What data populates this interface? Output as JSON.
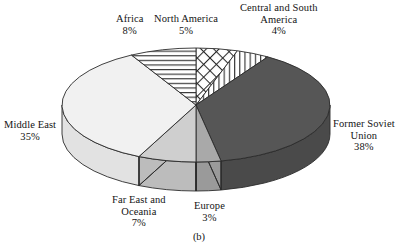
{
  "figure": {
    "caption": "(b)",
    "geometry": {
      "cx": 196,
      "cy": 105,
      "rx": 134,
      "ry": 57,
      "depth": 29,
      "start_angle_deg": -90,
      "direction": "clockwise"
    }
  },
  "chart_data": {
    "type": "pie",
    "title": "",
    "subtitle": "",
    "xlabel": "",
    "ylabel": "",
    "legend_position": "outside-labels",
    "grid": false,
    "units": "percent",
    "categories": [
      "North America",
      "Central and South America",
      "Former Soviet Union",
      "Europe",
      "Far East and Oceania",
      "Middle East",
      "Africa"
    ],
    "values": [
      5,
      4,
      38,
      3,
      7,
      35,
      8
    ],
    "value_labels": [
      "5%",
      "4%",
      "38%",
      "3%",
      "7%",
      "35%",
      "8%"
    ],
    "slices": [
      {
        "label": "North America",
        "value": 5,
        "value_label": "5%",
        "fill": "crosshatch",
        "color": "#ffffff",
        "side_color": "#e8e8e8",
        "label_pos": {
          "left": 154,
          "top": 13
        },
        "align": "center"
      },
      {
        "label": "Central and South America",
        "label_line1": "Central and South",
        "label_line2": "America",
        "value": 4,
        "value_label": "4%",
        "fill": "vertical-lines",
        "color": "#ffffff",
        "side_color": "#e8e8e8",
        "label_pos": {
          "left": 240,
          "top": 2
        },
        "align": "center"
      },
      {
        "label": "Former Soviet Union",
        "label_line1": "Former Soviet",
        "label_line2": "Union",
        "value": 38,
        "value_label": "38%",
        "fill": "solid",
        "color": "#565656",
        "side_color": "#4a4a4a",
        "label_pos": {
          "left": 333,
          "top": 118
        },
        "align": "center"
      },
      {
        "label": "Europe",
        "value": 3,
        "value_label": "3%",
        "fill": "solid",
        "color": "#a9a9a9",
        "side_color": "#9a9a9a",
        "label_pos": {
          "left": 194,
          "top": 200
        },
        "align": "center"
      },
      {
        "label": "Far East and Oceania",
        "label_line1": "Far East and",
        "label_line2": "Oceania",
        "value": 7,
        "value_label": "7%",
        "fill": "solid",
        "color": "#cfcfcf",
        "side_color": "#bcbcbc",
        "label_pos": {
          "left": 112,
          "top": 194
        },
        "align": "center"
      },
      {
        "label": "Middle East",
        "value": 35,
        "value_label": "35%",
        "fill": "solid",
        "color": "#f1f1f1",
        "side_color": "#e2e2e2",
        "label_pos": {
          "left": 4,
          "top": 119
        },
        "align": "center"
      },
      {
        "label": "Africa",
        "value": 8,
        "value_label": "8%",
        "fill": "horizontal-lines",
        "color": "#ffffff",
        "side_color": "#e8e8e8",
        "label_pos": {
          "left": 116,
          "top": 13
        },
        "align": "center"
      }
    ],
    "colors": {
      "outline": "#2b2b2b",
      "background": "#ffffff",
      "text": "#141414",
      "former_soviet_union": "#565656",
      "europe": "#a9a9a9",
      "far_east_and_oceania": "#cfcfcf",
      "middle_east": "#f1f1f1",
      "hatch_background": "#ffffff"
    }
  }
}
